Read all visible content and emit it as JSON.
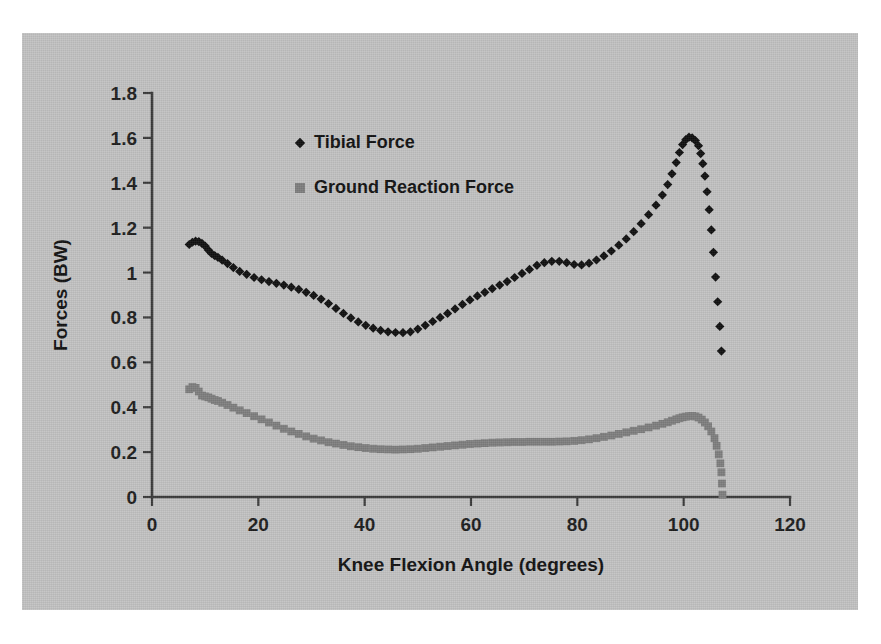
{
  "figure": {
    "background_color": "#c2c2c2",
    "page_color": "#ffffff"
  },
  "chart_data": {
    "type": "scatter",
    "title": "",
    "xlabel": "Knee Flexion Angle (degrees)",
    "ylabel": "Forces (BW)",
    "xlim": [
      0,
      120
    ],
    "ylim": [
      0,
      1.8
    ],
    "xticks": [
      0,
      20,
      40,
      60,
      80,
      100,
      120
    ],
    "yticks": [
      0,
      0.2,
      0.4,
      0.6,
      0.8,
      1,
      1.2,
      1.4,
      1.6,
      1.8
    ],
    "xtick_labels": [
      "0",
      "20",
      "40",
      "60",
      "80",
      "100",
      "120"
    ],
    "ytick_labels": [
      "0",
      "0.2",
      "0.4",
      "0.6",
      "0.8",
      "1",
      "1.2",
      "1.4",
      "1.6",
      "1.8"
    ],
    "grid": false,
    "legend_position": "upper-left-inside",
    "series": [
      {
        "name": "Tibial Force",
        "color": "#101010",
        "marker": "diamond",
        "x": [
          7.0,
          7.6,
          8.2,
          8.8,
          9.4,
          10.0,
          10.6,
          11.2,
          11.8,
          12.4,
          13.2,
          14.2,
          15.3,
          16.5,
          17.8,
          19.2,
          20.6,
          22.0,
          23.4,
          24.8,
          26.2,
          27.6,
          29.0,
          30.4,
          31.8,
          33.2,
          34.6,
          36.0,
          37.4,
          38.8,
          40.2,
          41.6,
          43.0,
          44.4,
          45.8,
          47.2,
          48.6,
          50.0,
          51.4,
          52.8,
          54.2,
          55.6,
          57.0,
          58.4,
          59.8,
          61.2,
          62.6,
          64.0,
          65.4,
          66.8,
          68.2,
          69.6,
          71.0,
          72.4,
          73.8,
          75.2,
          76.6,
          78.0,
          79.4,
          80.8,
          82.2,
          83.6,
          85.0,
          86.4,
          87.8,
          89.2,
          90.6,
          92.0,
          93.4,
          94.8,
          96.0,
          97.0,
          97.8,
          98.6,
          99.2,
          99.8,
          100.4,
          101.0,
          101.6,
          102.2,
          102.8,
          103.2,
          103.6,
          104.0,
          104.4,
          104.8,
          105.2,
          105.6,
          106.0,
          106.4,
          106.8,
          107.1
        ],
        "y": [
          1.125,
          1.135,
          1.14,
          1.138,
          1.13,
          1.118,
          1.1,
          1.085,
          1.075,
          1.068,
          1.055,
          1.04,
          1.022,
          1.005,
          0.992,
          0.978,
          0.968,
          0.96,
          0.952,
          0.944,
          0.935,
          0.925,
          0.912,
          0.898,
          0.882,
          0.862,
          0.84,
          0.818,
          0.798,
          0.78,
          0.765,
          0.752,
          0.742,
          0.736,
          0.733,
          0.732,
          0.736,
          0.748,
          0.765,
          0.782,
          0.8,
          0.818,
          0.838,
          0.858,
          0.878,
          0.896,
          0.912,
          0.928,
          0.944,
          0.96,
          0.978,
          0.996,
          1.014,
          1.032,
          1.044,
          1.05,
          1.05,
          1.044,
          1.036,
          1.034,
          1.042,
          1.056,
          1.074,
          1.096,
          1.122,
          1.15,
          1.182,
          1.218,
          1.258,
          1.3,
          1.345,
          1.392,
          1.44,
          1.49,
          1.535,
          1.57,
          1.592,
          1.603,
          1.6,
          1.588,
          1.565,
          1.53,
          1.485,
          1.43,
          1.36,
          1.28,
          1.19,
          1.09,
          0.98,
          0.87,
          0.76,
          0.65
        ],
        "peak_value": 1.6,
        "peak_x": 101,
        "min_value": 0.73,
        "min_x": 45
      },
      {
        "name": "Ground Reaction Force",
        "color": "#7e7e7e",
        "marker": "square",
        "x": [
          7.0,
          7.6,
          8.2,
          8.8,
          9.4,
          10.0,
          10.6,
          11.2,
          11.8,
          12.4,
          13.2,
          14.2,
          15.3,
          16.5,
          17.8,
          19.2,
          20.6,
          22.0,
          23.4,
          24.8,
          26.2,
          27.6,
          29.0,
          30.4,
          31.8,
          33.2,
          34.6,
          36.0,
          37.4,
          38.8,
          40.2,
          41.6,
          43.0,
          44.4,
          45.8,
          47.2,
          48.6,
          50.0,
          51.4,
          52.8,
          54.2,
          55.6,
          57.0,
          58.4,
          59.8,
          61.2,
          62.6,
          64.0,
          65.4,
          66.8,
          68.2,
          69.6,
          71.0,
          72.4,
          73.8,
          75.2,
          76.6,
          78.0,
          79.4,
          80.8,
          82.2,
          83.6,
          85.0,
          86.4,
          87.8,
          89.2,
          90.6,
          92.0,
          93.4,
          94.8,
          96.0,
          97.0,
          97.8,
          98.6,
          99.2,
          99.8,
          100.4,
          101.0,
          101.6,
          102.2,
          102.8,
          103.4,
          104.0,
          104.6,
          105.2,
          105.8,
          106.2,
          106.6,
          106.9,
          107.1,
          107.2,
          107.3
        ],
        "y": [
          0.48,
          0.49,
          0.486,
          0.47,
          0.452,
          0.448,
          0.444,
          0.438,
          0.432,
          0.428,
          0.42,
          0.41,
          0.398,
          0.386,
          0.374,
          0.36,
          0.346,
          0.332,
          0.318,
          0.304,
          0.292,
          0.281,
          0.27,
          0.26,
          0.252,
          0.244,
          0.238,
          0.232,
          0.226,
          0.222,
          0.218,
          0.215,
          0.213,
          0.212,
          0.211,
          0.212,
          0.213,
          0.215,
          0.218,
          0.221,
          0.224,
          0.227,
          0.23,
          0.233,
          0.236,
          0.238,
          0.24,
          0.242,
          0.243,
          0.244,
          0.245,
          0.245,
          0.246,
          0.246,
          0.246,
          0.246,
          0.247,
          0.248,
          0.25,
          0.253,
          0.257,
          0.262,
          0.268,
          0.274,
          0.281,
          0.288,
          0.295,
          0.302,
          0.31,
          0.318,
          0.326,
          0.333,
          0.34,
          0.346,
          0.351,
          0.355,
          0.358,
          0.36,
          0.361,
          0.359,
          0.354,
          0.345,
          0.332,
          0.315,
          0.292,
          0.262,
          0.228,
          0.19,
          0.15,
          0.11,
          0.06,
          0.01
        ],
        "peak_value": 0.36,
        "peak_x": 101,
        "min_value": 0.21,
        "min_x": 46
      }
    ]
  },
  "legend": {
    "items": [
      {
        "label": "Tibial Force",
        "marker": "diamond",
        "color": "#101010"
      },
      {
        "label": "Ground Reaction Force",
        "marker": "square",
        "color": "#7e7e7e"
      }
    ]
  }
}
